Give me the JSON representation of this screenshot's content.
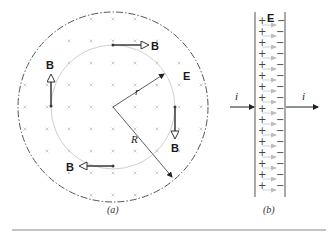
{
  "figure_a": {
    "caption": "(a)",
    "outer_label": "R",
    "inner_label": "r",
    "field_label_E": "E",
    "b_labels": [
      "B",
      "B",
      "B",
      "B"
    ]
  },
  "figure_b": {
    "caption": "(b)",
    "field_label_E": "E",
    "current_left": "i",
    "current_right": "i",
    "plus_sign": "+",
    "minus_sign": "−"
  },
  "colors": {
    "ink": "#1a1a1a",
    "arrow_fill": "#ffffff",
    "grid_mark": "#b0b0b0",
    "inner_circle": "#c8c8c8",
    "field_arrow": "#bdbdbd",
    "rule": "#777777"
  }
}
